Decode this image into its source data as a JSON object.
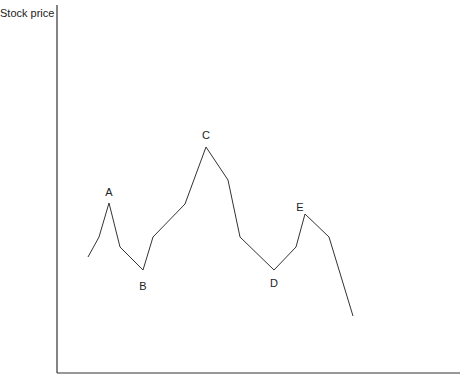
{
  "chart_data": {
    "type": "line",
    "title": "",
    "xlabel": "",
    "ylabel": "Stock price",
    "grid": false,
    "legend": null,
    "series": [
      {
        "name": "Stock price",
        "points_px": [
          [
            88,
            257
          ],
          [
            99,
            237
          ],
          [
            109,
            203
          ],
          [
            120,
            247
          ],
          [
            143,
            270
          ],
          [
            153,
            237
          ],
          [
            185,
            204
          ],
          [
            206,
            147
          ],
          [
            228,
            180
          ],
          [
            240,
            237
          ],
          [
            274,
            270
          ],
          [
            296,
            247
          ],
          [
            305,
            214
          ],
          [
            329,
            237
          ],
          [
            353,
            316
          ]
        ]
      }
    ],
    "annotations": [
      {
        "label": "A",
        "x": 109,
        "y": 196
      },
      {
        "label": "B",
        "x": 143,
        "y": 290
      },
      {
        "label": "C",
        "x": 206,
        "y": 139
      },
      {
        "label": "D",
        "x": 274,
        "y": 287
      },
      {
        "label": "E",
        "x": 300,
        "y": 211
      }
    ]
  }
}
